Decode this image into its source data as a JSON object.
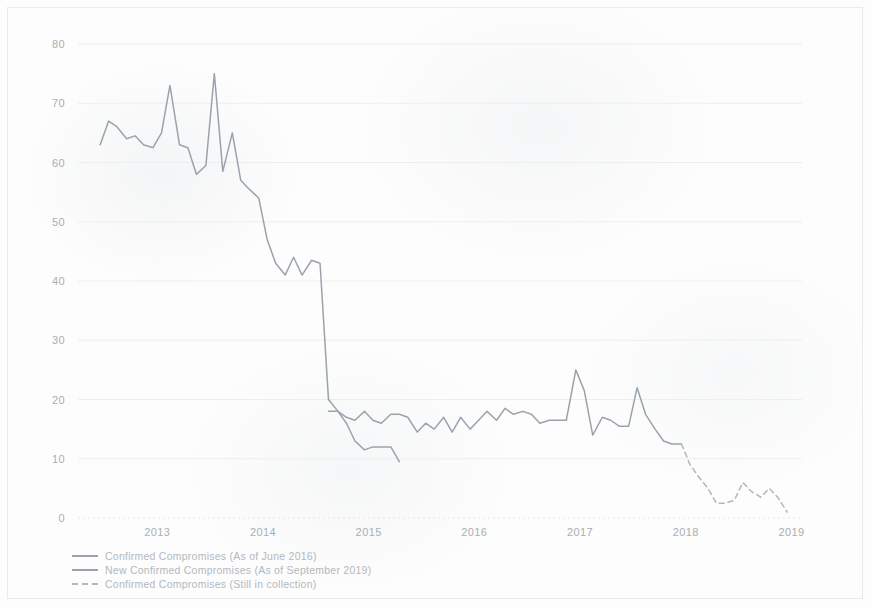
{
  "chart_data": {
    "type": "line",
    "title": "",
    "subtitle": "",
    "xlabel": "",
    "ylabel": "",
    "xlim": [
      2012.75,
      2019.6
    ],
    "ylim": [
      0,
      80
    ],
    "grid": true,
    "legend_position": "bottom-left",
    "x_tick_labels": [
      "2013",
      "2014",
      "2015",
      "2016",
      "2017",
      "2018",
      "2019"
    ],
    "x_tick_values": [
      2013,
      2014,
      2015,
      2016,
      2017,
      2018,
      2019
    ],
    "y_tick_labels": [
      "0",
      "10",
      "20",
      "30",
      "40",
      "50",
      "60",
      "70",
      "80"
    ],
    "y_tick_values": [
      0,
      10,
      20,
      30,
      40,
      50,
      60,
      70,
      80
    ],
    "colors": {
      "confirmed_compromises_june_2016": "#9aa3ad",
      "new_confirmed_compromises_september_2019": "#9aa3ad",
      "confirmed_compromises_still_in_collection": "#b0b7bf"
    },
    "series": [
      {
        "name": "Confirmed Compromises (As of June 2016)",
        "style": "solid",
        "color": "#9aa3ad",
        "x": [
          2012.96,
          2013.04,
          2013.12,
          2013.21,
          2013.29,
          2013.37,
          2013.46,
          2013.54,
          2013.62,
          2013.71,
          2013.79,
          2013.87,
          2013.96,
          2014.04,
          2014.12,
          2014.21,
          2014.29,
          2014.37,
          2014.46,
          2014.54,
          2014.62,
          2014.71,
          2014.79,
          2014.87,
          2014.96,
          2015.04,
          2015.12,
          2015.21,
          2015.29,
          2015.37,
          2015.46,
          2015.54,
          2015.62,
          2015.71,
          2015.79
        ],
        "values": [
          63,
          67,
          66,
          64,
          64.5,
          63,
          62.5,
          65,
          73,
          63,
          62.5,
          58,
          59.5,
          75,
          58.5,
          65,
          57,
          55.5,
          54,
          47,
          43,
          41,
          44,
          41,
          43.5,
          43,
          20,
          18,
          16,
          13,
          11.5,
          12,
          12,
          12,
          9.5
        ]
      },
      {
        "name": "New Confirmed Compromises (As of September 2019)",
        "style": "solid",
        "color": "#9aa3ad",
        "x": [
          2015.12,
          2015.21,
          2015.29,
          2015.37,
          2015.46,
          2015.54,
          2015.62,
          2015.71,
          2015.79,
          2015.87,
          2015.96,
          2016.04,
          2016.12,
          2016.21,
          2016.29,
          2016.37,
          2016.46,
          2016.54,
          2016.62,
          2016.71,
          2016.79,
          2016.87,
          2016.96,
          2017.04,
          2017.12,
          2017.21,
          2017.29,
          2017.37,
          2017.46,
          2017.54,
          2017.62,
          2017.71,
          2017.79,
          2017.87,
          2017.96,
          2018.04,
          2018.12,
          2018.21,
          2018.29,
          2018.37,
          2018.46
        ],
        "values": [
          18,
          18,
          17,
          16.5,
          18,
          16.5,
          16,
          17.5,
          17.5,
          17,
          14.5,
          16,
          15,
          17,
          14.5,
          17,
          15,
          16.5,
          18,
          16.5,
          18.5,
          17.5,
          18,
          17.5,
          16,
          16.5,
          16.5,
          16.5,
          25,
          21.5,
          14,
          17,
          16.5,
          15.5,
          15.5,
          22,
          17.5,
          15,
          13,
          12.5,
          12.5
        ]
      },
      {
        "name": "Confirmed Compromises (Still in collection)",
        "style": "dashed",
        "color": "#b0b7bf",
        "x": [
          2018.46,
          2018.54,
          2018.62,
          2018.71,
          2018.79,
          2018.87,
          2018.96,
          2019.04,
          2019.12,
          2019.21,
          2019.29,
          2019.37,
          2019.46
        ],
        "values": [
          12.5,
          9,
          7,
          5,
          2.5,
          2.5,
          3,
          6,
          4.5,
          3.5,
          5,
          3.5,
          1
        ]
      }
    ]
  },
  "legend": {
    "items": [
      {
        "label": "Confirmed Compromises (As of June 2016)",
        "color": "#9aa3ad",
        "style": "solid"
      },
      {
        "label": "New Confirmed Compromises (As of September 2019)",
        "color": "#9aa3ad",
        "style": "solid"
      },
      {
        "label": "Confirmed Compromises (Still in collection)",
        "color": "#b0b7bf",
        "style": "dashed"
      }
    ]
  }
}
